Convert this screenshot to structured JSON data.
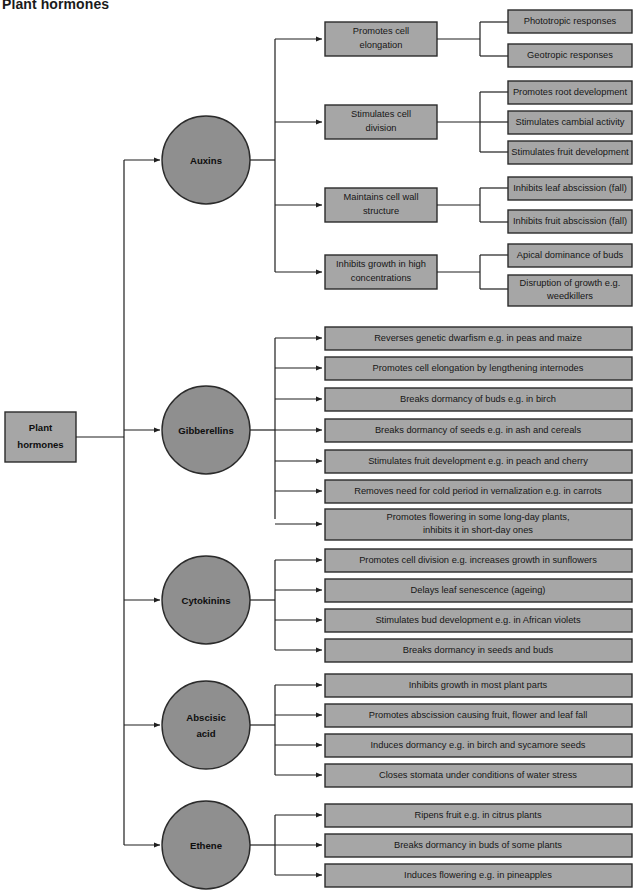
{
  "title": "Plant hormones",
  "colors": {
    "box_fill": "#a6a6a6",
    "circle_fill": "#8f8f8f",
    "stroke": "#2b2b2b",
    "text": "#161616",
    "background": "#ffffff"
  },
  "root": {
    "label_line1": "Plant",
    "label_line2": "hormones"
  },
  "branches": [
    {
      "name": "auxins",
      "label": "Auxins",
      "children": [
        {
          "name": "promotes-cell-elongation",
          "label_line1": "Promotes cell",
          "label_line2": "elongation",
          "leaves": [
            {
              "name": "phototropic-responses",
              "label_line1": "Phototropic responses",
              "label_line2": ""
            },
            {
              "name": "geotropic-responses",
              "label_line1": "Geotropic responses",
              "label_line2": ""
            }
          ]
        },
        {
          "name": "stimulates-cell-division",
          "label_line1": "Stimulates cell",
          "label_line2": "division",
          "leaves": [
            {
              "name": "promotes-root-development",
              "label_line1": "Promotes root development",
              "label_line2": ""
            },
            {
              "name": "stimulates-cambial-activity",
              "label_line1": "Stimulates cambial activity",
              "label_line2": ""
            },
            {
              "name": "stimulates-fruit-development",
              "label_line1": "Stimulates fruit development",
              "label_line2": ""
            }
          ]
        },
        {
          "name": "maintains-cell-wall-structure",
          "label_line1": "Maintains cell wall",
          "label_line2": "structure",
          "leaves": [
            {
              "name": "inhibits-leaf-abscission",
              "label_line1": "Inhibits leaf abscission (fall)",
              "label_line2": ""
            },
            {
              "name": "inhibits-fruit-abscission",
              "label_line1": "Inhibits fruit abscission (fall)",
              "label_line2": ""
            }
          ]
        },
        {
          "name": "inhibits-growth-high-concentrations",
          "label_line1": "Inhibits growth in high",
          "label_line2": "concentrations",
          "leaves": [
            {
              "name": "apical-dominance-of-buds",
              "label_line1": "Apical dominance of buds",
              "label_line2": ""
            },
            {
              "name": "disruption-of-growth",
              "label_line1": "Disruption of growth e.g.",
              "label_line2": "weedkillers"
            }
          ]
        }
      ]
    },
    {
      "name": "gibberellins",
      "label": "Gibberellins",
      "children": [
        {
          "name": "reverses-genetic-dwarfism",
          "label_line1": "Reverses genetic dwarfism e.g. in peas and maize",
          "label_line2": ""
        },
        {
          "name": "promotes-cell-elongation-internodes",
          "label_line1": "Promotes cell elongation by lengthening internodes",
          "label_line2": ""
        },
        {
          "name": "breaks-dormancy-of-buds",
          "label_line1": "Breaks dormancy of buds e.g. in birch",
          "label_line2": ""
        },
        {
          "name": "breaks-dormancy-of-seeds",
          "label_line1": "Breaks dormancy of seeds e.g. in ash and cereals",
          "label_line2": ""
        },
        {
          "name": "stimulates-fruit-development-peach",
          "label_line1": "Stimulates fruit development e.g. in peach and cherry",
          "label_line2": ""
        },
        {
          "name": "removes-need-for-cold-period",
          "label_line1": "Removes need for cold period in vernalization e.g. in carrots",
          "label_line2": ""
        },
        {
          "name": "promotes-flowering-long-day",
          "label_line1": "Promotes flowering in some long-day plants,",
          "label_line2": "inhibits it in short-day ones"
        }
      ]
    },
    {
      "name": "cytokinins",
      "label": "Cytokinins",
      "children": [
        {
          "name": "promotes-cell-division-sunflowers",
          "label_line1": "Promotes cell division e.g. increases growth in sunflowers",
          "label_line2": ""
        },
        {
          "name": "delays-leaf-senescence",
          "label_line1": "Delays leaf senescence (ageing)",
          "label_line2": ""
        },
        {
          "name": "stimulates-bud-development",
          "label_line1": "Stimulates bud development e.g. in African violets",
          "label_line2": ""
        },
        {
          "name": "breaks-dormancy-seeds-buds",
          "label_line1": "Breaks dormancy in seeds and buds",
          "label_line2": ""
        }
      ]
    },
    {
      "name": "abscisic-acid",
      "label_line1": "Abscisic",
      "label_line2": "acid",
      "children": [
        {
          "name": "inhibits-growth-most-plant-parts",
          "label_line1": "Inhibits growth in most plant parts",
          "label_line2": ""
        },
        {
          "name": "promotes-abscission",
          "label_line1": "Promotes abscission causing fruit, flower and leaf fall",
          "label_line2": ""
        },
        {
          "name": "induces-dormancy-birch-sycamore",
          "label_line1": "Induces dormancy e.g. in birch and sycamore seeds",
          "label_line2": ""
        },
        {
          "name": "closes-stomata-water-stress",
          "label_line1": "Closes stomata under conditions of water stress",
          "label_line2": ""
        }
      ]
    },
    {
      "name": "ethene",
      "label": "Ethene",
      "children": [
        {
          "name": "ripens-fruit-citrus",
          "label_line1": "Ripens fruit e.g. in citrus plants",
          "label_line2": ""
        },
        {
          "name": "breaks-dormancy-buds-some-plants",
          "label_line1": "Breaks dormancy in buds of some plants",
          "label_line2": ""
        },
        {
          "name": "induces-flowering-pineapples",
          "label_line1": "Induces flowering e.g. in pineapples",
          "label_line2": ""
        }
      ]
    }
  ]
}
